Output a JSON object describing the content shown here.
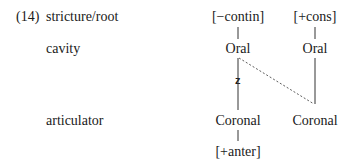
{
  "example": {
    "number": "(14)",
    "tiers": [
      {
        "label": "stricture/root"
      },
      {
        "label": "cavity"
      },
      {
        "label": "articulator"
      }
    ]
  },
  "tree": {
    "left": {
      "stricture": "[−contin]",
      "cavity": "Oral",
      "articulator": "Coronal",
      "dependent": "[+anter]"
    },
    "right": {
      "stricture": "[+cons]",
      "cavity": "Oral",
      "articulator": "Coronal"
    },
    "association_mark": "z"
  }
}
